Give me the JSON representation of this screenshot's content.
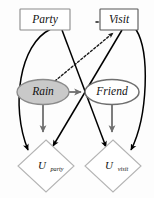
{
  "diagram": {
    "kind": "influence-diagram",
    "nodes": [
      {
        "id": "party",
        "label": "Party",
        "shape": "rectangle",
        "role": "decision",
        "fill": "#ffffff",
        "stroke": "#8a8a8a",
        "x": 45,
        "y": 19,
        "w": 50,
        "h": 20
      },
      {
        "id": "visit",
        "label": "Visit",
        "shape": "rectangle",
        "role": "decision",
        "fill": "#ffffff",
        "stroke": "#555555",
        "x": 119,
        "y": 19,
        "w": 38,
        "h": 20
      },
      {
        "id": "rain",
        "label": "Rain",
        "shape": "ellipse",
        "role": "chance",
        "fill": "#c9c9c9",
        "stroke": "#8a8a8a",
        "x": 43,
        "y": 92,
        "rx": 26,
        "ry": 13
      },
      {
        "id": "friend",
        "label": "Friend",
        "shape": "ellipse",
        "role": "chance",
        "fill": "#ffffff",
        "stroke": "#6f6f6f",
        "x": 112,
        "y": 92,
        "rx": 27,
        "ry": 13
      },
      {
        "id": "u_party",
        "label": "U",
        "sublabel": "party",
        "shape": "diamond",
        "role": "utility",
        "fill": "#ffffff",
        "stroke": "#b4b4b4",
        "x": 46,
        "y": 166,
        "rx": 28,
        "ry": 26
      },
      {
        "id": "u_visit",
        "label": "U",
        "sublabel": "visit",
        "shape": "diamond",
        "role": "utility",
        "fill": "#ffffff",
        "stroke": "#b4b4b4",
        "x": 113,
        "y": 166,
        "rx": 28,
        "ry": 26
      }
    ],
    "edges": [
      {
        "id": "party-visit",
        "from": "Party",
        "to": "Visit",
        "style": "dotted",
        "color": "#1a1a1a"
      },
      {
        "id": "rain-visit",
        "from": "Rain",
        "to": "Visit",
        "style": "dotted",
        "color": "#1a1a1a"
      },
      {
        "id": "party-uparty",
        "from": "Party",
        "to": "U_party",
        "style": "solid-curved",
        "color": "#000000"
      },
      {
        "id": "party-uvisit",
        "from": "Party",
        "to": "U_visit",
        "style": "solid",
        "color": "#000000"
      },
      {
        "id": "visit-uparty",
        "from": "Visit",
        "to": "U_party",
        "style": "solid",
        "color": "#000000"
      },
      {
        "id": "visit-uvisit",
        "from": "Visit",
        "to": "U_visit",
        "style": "solid-curved",
        "color": "#000000"
      },
      {
        "id": "rain-uparty",
        "from": "Rain",
        "to": "U_party",
        "style": "solid",
        "color": "#6f6f6f"
      },
      {
        "id": "rain-friend",
        "from": "Rain",
        "to": "Friend",
        "style": "solid",
        "color": "#6f6f6f"
      },
      {
        "id": "friend-uvisit",
        "from": "Friend",
        "to": "U_visit",
        "style": "solid",
        "color": "#6f6f6f"
      }
    ]
  }
}
